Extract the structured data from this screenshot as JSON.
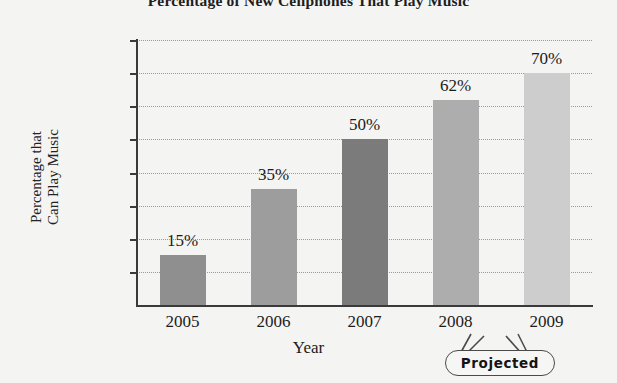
{
  "chart_data": {
    "type": "bar",
    "title": "Percentage of New Cellphones That Play Music",
    "xlabel": "Year",
    "ylabel": "Percentage that\nCan Play Music",
    "categories": [
      "2005",
      "2006",
      "2007",
      "2008",
      "2009"
    ],
    "values": [
      15,
      35,
      50,
      62,
      70
    ],
    "value_labels": [
      "15%",
      "35%",
      "50%",
      "62%",
      "70%"
    ],
    "bar_colors": [
      "#8f8f8f",
      "#9d9d9d",
      "#7b7b7b",
      "#adadad",
      "#cdcdcd"
    ],
    "ylim": [
      0,
      80
    ],
    "yticks": [
      10,
      20,
      30,
      40,
      50,
      60,
      70,
      80
    ],
    "ytick_labels": [
      "10%",
      "20%",
      "30%",
      "40%",
      "50%",
      "60%",
      "70%",
      "80%"
    ],
    "grid": true,
    "grid_style": "dotted",
    "legend": null,
    "annotations": [
      {
        "name": "projected-callout",
        "text": "Projected",
        "points_to": [
          "2008",
          "2009"
        ]
      }
    ]
  },
  "colors": {
    "background": "#f4f4f2",
    "axis": "#3a3a3a",
    "gridline": "#9a9a9a",
    "text": "#1c1c1c"
  }
}
